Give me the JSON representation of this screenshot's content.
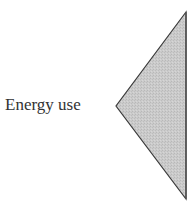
{
  "diagram": {
    "label": "Energy use",
    "shape": {
      "type": "triangle",
      "points": [
        [
          186,
          12
        ],
        [
          116,
          106
        ],
        [
          186,
          199
        ]
      ],
      "fill": "#c9c9c9",
      "stroke": "#3a3a3a",
      "right_edge_stroke": "#555555"
    }
  }
}
